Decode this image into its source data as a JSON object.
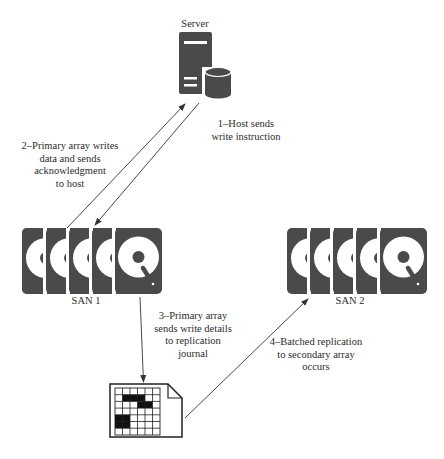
{
  "server": {
    "label": "Server"
  },
  "san1": {
    "label": "SAN 1",
    "disk_count": 5
  },
  "san2": {
    "label": "SAN 2",
    "disk_count": 5
  },
  "steps": [
    {
      "id": 1,
      "text": "1–Host sends\nwrite instruction"
    },
    {
      "id": 2,
      "text": "2–Primary array writes\ndata and sends\nacknowledgment\nto host"
    },
    {
      "id": 3,
      "text": "3–Primary array\nsends write details\nto replication\njournal"
    },
    {
      "id": 4,
      "text": "4–Batched replication\nto secondary array\noccurs"
    }
  ],
  "journal": {
    "label": "replication journal",
    "grid_cols": 6,
    "grid_rows": 7
  },
  "colors": {
    "icon_fill": "#4a4a4a",
    "line": "#333333",
    "background": "#ffffff"
  }
}
